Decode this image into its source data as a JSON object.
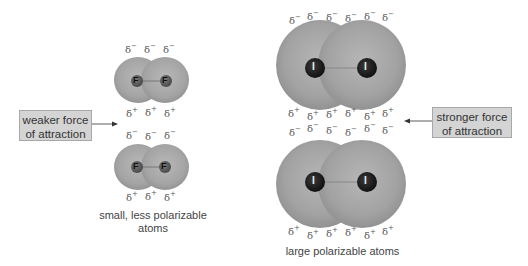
{
  "left_panel": {
    "label_box": {
      "line1": "weaker force",
      "line2": "of attraction"
    },
    "caption": {
      "line1": "small, less polarizable",
      "line2": "atoms"
    },
    "atom_symbol": "F",
    "molecule": "F2",
    "top_row_charges": [
      "δ−",
      "δ−",
      "δ−"
    ],
    "mid_upper_charges": [
      "δ+",
      "δ+",
      "δ+"
    ],
    "mid_lower_charges": [
      "δ−",
      "δ−",
      "δ−"
    ],
    "bottom_row_charges": [
      "δ+",
      "δ+",
      "δ+"
    ]
  },
  "right_panel": {
    "label_box": {
      "line1": "stronger force",
      "line2": "of attraction"
    },
    "caption": {
      "line1": "large polarizable atoms"
    },
    "atom_symbol": "I",
    "molecule": "I2",
    "top_row_charges": [
      "δ−",
      "δ−",
      "δ−",
      "δ−",
      "δ−",
      "δ−"
    ],
    "mid_upper_charges": [
      "δ+",
      "δ+",
      "δ+",
      "δ+",
      "δ+",
      "δ+"
    ],
    "mid_lower_charges": [
      "δ−",
      "δ−",
      "δ−",
      "δ−",
      "δ−",
      "δ−"
    ],
    "bottom_row_charges": [
      "δ+",
      "δ+",
      "δ+",
      "δ+",
      "δ+",
      "δ+"
    ]
  },
  "colors": {
    "cloud_light": "#b4b4b4",
    "cloud_dark": "#8a8a8a",
    "label_box_fill": "#d4d4d4",
    "iodine_atom": "#1e1e1e",
    "fluorine_atom": "#5a5a5a"
  }
}
